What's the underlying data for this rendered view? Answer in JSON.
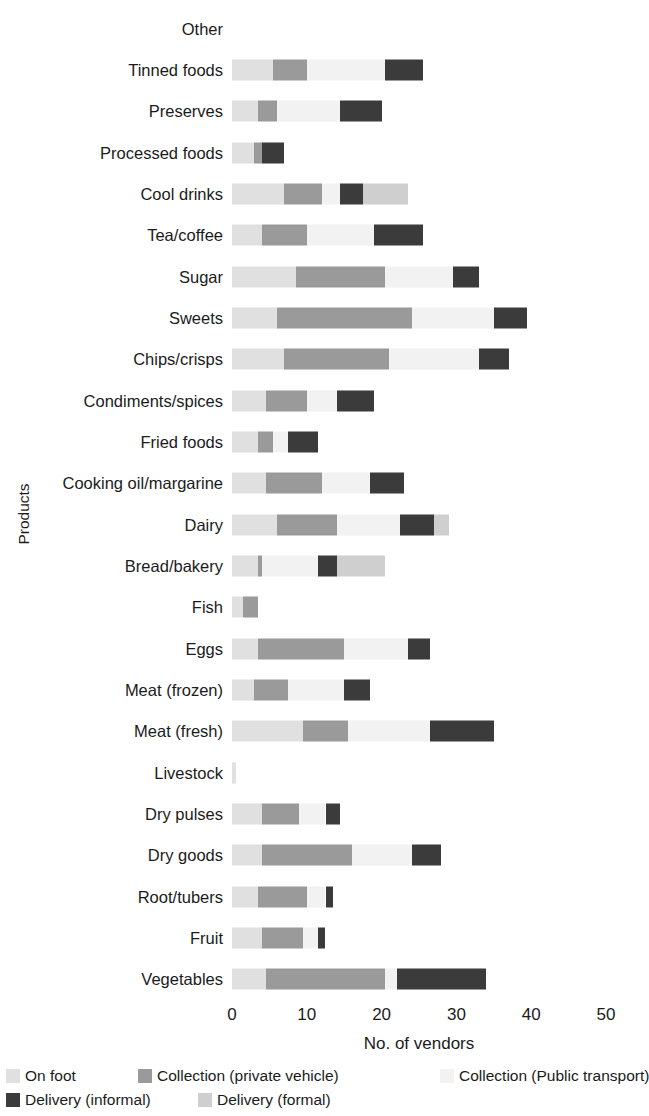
{
  "chart_data": {
    "type": "bar",
    "orientation": "horizontal",
    "stacked": true,
    "title": "",
    "xlabel": "No. of vendors",
    "ylabel": "Products",
    "xlim": [
      0,
      50
    ],
    "xticks": [
      0,
      10,
      20,
      30,
      40,
      50
    ],
    "xtick_labels": [
      "0",
      "10",
      "20",
      "30",
      "40",
      "50"
    ],
    "grid": false,
    "legend_position": "bottom-left",
    "categories": [
      "Other",
      "Tinned foods",
      "Preserves",
      "Processed foods",
      "Cool drinks",
      "Tea/coffee",
      "Sugar",
      "Sweets",
      "Chips/crisps",
      "Condiments/spices",
      "Fried foods",
      "Cooking oil/margarine",
      "Dairy",
      "Bread/bakery",
      "Fish",
      "Eggs",
      "Meat (frozen)",
      "Meat (fresh)",
      "Livestock",
      "Dry pulses",
      "Dry goods",
      "Root/tubers",
      "Fruit",
      "Vegetables"
    ],
    "series": [
      {
        "name": "On foot",
        "color": "#e0e0e0",
        "values": [
          0,
          5.5,
          3.5,
          3.0,
          7.0,
          4.0,
          8.5,
          6.0,
          7.0,
          4.5,
          3.5,
          4.5,
          6.0,
          3.5,
          1.5,
          3.5,
          3.0,
          9.5,
          0.5,
          4.0,
          4.0,
          3.5,
          4.0,
          4.5
        ]
      },
      {
        "name": "Collection (private vehicle)",
        "color": "#9a9a9a",
        "values": [
          0,
          4.5,
          2.5,
          1.0,
          5.0,
          6.0,
          12.0,
          18.0,
          14.0,
          5.5,
          2.0,
          7.5,
          8.0,
          0.5,
          2.0,
          11.5,
          4.5,
          6.0,
          0,
          5.0,
          12.0,
          6.5,
          5.5,
          16.0
        ]
      },
      {
        "name": "Collection (Public transport)",
        "color": "#f2f2f2",
        "values": [
          0,
          10.5,
          8.5,
          0,
          2.5,
          9.0,
          9.0,
          11.0,
          12.0,
          4.0,
          2.0,
          6.5,
          8.5,
          7.5,
          0,
          8.5,
          7.5,
          11.0,
          0,
          3.5,
          8.0,
          2.5,
          2.0,
          1.5
        ]
      },
      {
        "name": "Delivery (informal)",
        "color": "#3b3b3b",
        "values": [
          0,
          5.0,
          5.5,
          3.0,
          3.0,
          6.5,
          3.5,
          4.5,
          4.0,
          5.0,
          4.0,
          4.5,
          4.5,
          2.5,
          0,
          3.0,
          3.5,
          8.5,
          0,
          2.0,
          4.0,
          1.0,
          1.0,
          12.0
        ]
      },
      {
        "name": "Delivery (formal)",
        "color": "#cfcfcf",
        "values": [
          0,
          0,
          0,
          0,
          6.0,
          0,
          0,
          0,
          0,
          0,
          0,
          0,
          2.0,
          6.5,
          0,
          0,
          0,
          0,
          0,
          0,
          0,
          0,
          0,
          0
        ]
      }
    ]
  },
  "legend": {
    "items": [
      {
        "label": "On foot",
        "color": "#e0e0e0"
      },
      {
        "label": "Collection (private vehicle)",
        "color": "#9a9a9a"
      },
      {
        "label": "Collection (Public transport)",
        "color": "#f2f2f2"
      },
      {
        "label": "Delivery (informal)",
        "color": "#3b3b3b"
      },
      {
        "label": "Delivery (formal)",
        "color": "#cfcfcf"
      }
    ]
  }
}
